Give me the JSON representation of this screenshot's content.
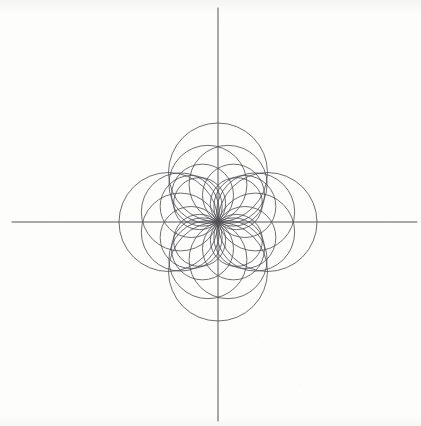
{
  "figure": {
    "background_color": "#fdfdfc",
    "curve_color": "#4a4a50",
    "axis_color": "#55555a",
    "curve_stroke_width": 0.8,
    "axis_stroke_width": 1.0,
    "origin": {
      "x": 218,
      "y": 222
    },
    "axes": {
      "x_axis": {
        "x1": 12,
        "y1": 222,
        "x2": 417,
        "y2": 222,
        "label": "x-axis"
      },
      "y_axis": {
        "x1": 218,
        "y1": 8,
        "x2": 218,
        "y2": 421,
        "label": "y-axis"
      }
    }
  },
  "chart_data": {
    "type": "line",
    "subtitle": "Family r = a(theta) cos(theta - phi)",
    "xlabel": "",
    "ylabel": "",
    "grid": false,
    "legend": "none",
    "xlim": [
      -206,
      199
    ],
    "ylim": [
      -199,
      214
    ],
    "coordinate_system": "cartesian-pixels",
    "curve_family": "circles-through-origin",
    "circle_count": 12,
    "angle_step_deg": 30,
    "radius_max": 99,
    "radius_min": 51,
    "axis_crossings": {
      "positive_x": [
        51,
        99
      ],
      "negative_x": [
        -51,
        -99
      ],
      "positive_y": [
        51,
        99
      ],
      "negative_y": [
        -51,
        -99
      ]
    },
    "series": [
      {
        "name": "circle-1",
        "phi_deg": 0,
        "radius": 99,
        "center": [
          99,
          0
        ]
      },
      {
        "name": "circle-2",
        "phi_deg": 30,
        "radius": 62,
        "center": [
          53.7,
          31.0
        ]
      },
      {
        "name": "circle-3",
        "phi_deg": 60,
        "radius": 62,
        "center": [
          31.0,
          53.7
        ]
      },
      {
        "name": "circle-4",
        "phi_deg": 90,
        "radius": 99,
        "center": [
          0,
          99
        ]
      },
      {
        "name": "circle-5",
        "phi_deg": 120,
        "radius": 62,
        "center": [
          -31.0,
          53.7
        ]
      },
      {
        "name": "circle-6",
        "phi_deg": 150,
        "radius": 62,
        "center": [
          -53.7,
          31.0
        ]
      },
      {
        "name": "circle-7",
        "phi_deg": 180,
        "radius": 99,
        "center": [
          -99,
          0
        ]
      },
      {
        "name": "circle-8",
        "phi_deg": 210,
        "radius": 62,
        "center": [
          -53.7,
          -31.0
        ]
      },
      {
        "name": "circle-9",
        "phi_deg": 240,
        "radius": 62,
        "center": [
          -31.0,
          -53.7
        ]
      },
      {
        "name": "circle-10",
        "phi_deg": 270,
        "radius": 99,
        "center": [
          0,
          -99
        ]
      },
      {
        "name": "circle-11",
        "phi_deg": 300,
        "radius": 62,
        "center": [
          31.0,
          -53.7
        ]
      },
      {
        "name": "circle-12",
        "phi_deg": 330,
        "radius": 62,
        "center": [
          53.7,
          -31.0
        ]
      },
      {
        "name": "circle-13",
        "phi_deg": 15,
        "radius": 78,
        "center": [
          75.3,
          20.2
        ]
      },
      {
        "name": "circle-14",
        "phi_deg": 45,
        "radius": 52,
        "center": [
          36.8,
          36.8
        ]
      },
      {
        "name": "circle-15",
        "phi_deg": 75,
        "radius": 78,
        "center": [
          20.2,
          75.3
        ]
      },
      {
        "name": "circle-16",
        "phi_deg": 105,
        "radius": 78,
        "center": [
          -20.2,
          75.3
        ]
      },
      {
        "name": "circle-17",
        "phi_deg": 135,
        "radius": 52,
        "center": [
          -36.8,
          36.8
        ]
      },
      {
        "name": "circle-18",
        "phi_deg": 165,
        "radius": 78,
        "center": [
          -75.3,
          20.2
        ]
      },
      {
        "name": "circle-19",
        "phi_deg": 195,
        "radius": 78,
        "center": [
          -75.3,
          -20.2
        ]
      },
      {
        "name": "circle-20",
        "phi_deg": 225,
        "radius": 52,
        "center": [
          -36.8,
          -36.8
        ]
      },
      {
        "name": "circle-21",
        "phi_deg": 255,
        "radius": 78,
        "center": [
          -20.2,
          -75.3
        ]
      },
      {
        "name": "circle-22",
        "phi_deg": 285,
        "radius": 78,
        "center": [
          20.2,
          -75.3
        ]
      },
      {
        "name": "circle-23",
        "phi_deg": 315,
        "radius": 52,
        "center": [
          36.8,
          -36.8
        ]
      },
      {
        "name": "circle-24",
        "phi_deg": 345,
        "radius": 78,
        "center": [
          75.3,
          -20.2
        ]
      }
    ],
    "annotations": []
  }
}
